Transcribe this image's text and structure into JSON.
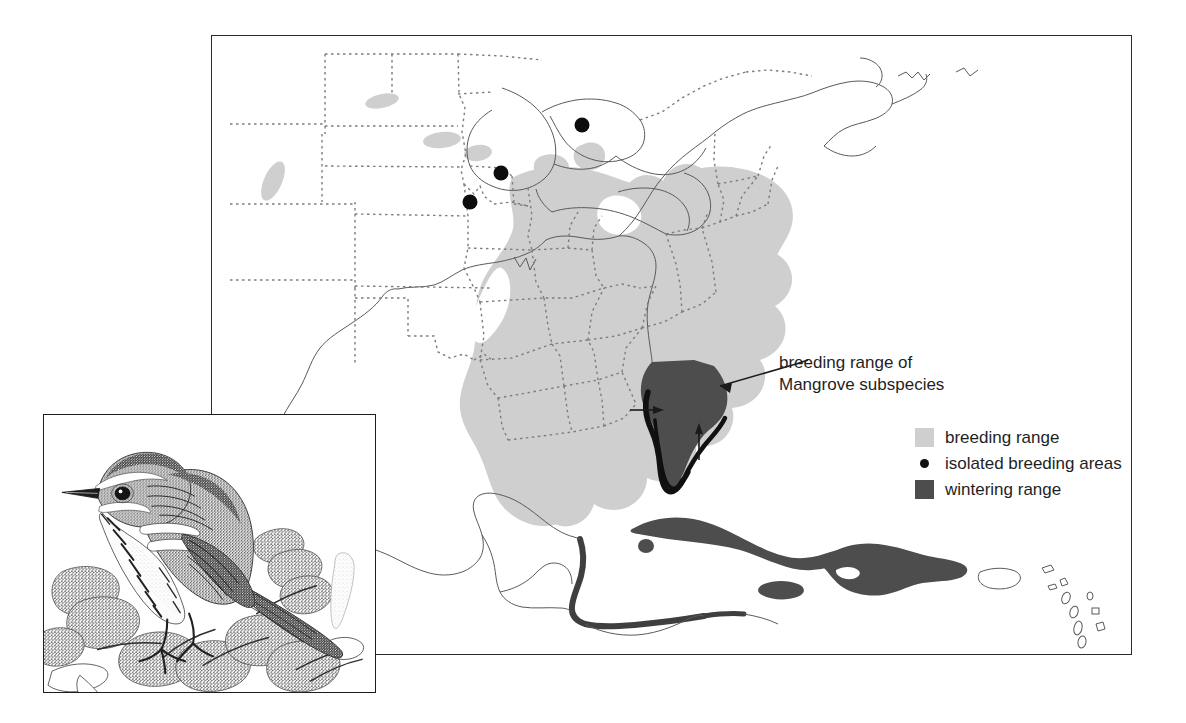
{
  "figure": {
    "kind": "range-map-with-illustration"
  },
  "annotation": {
    "line1": "breeding range of",
    "line2": "Mangrove subspecies"
  },
  "legend": {
    "items": [
      {
        "key": "breeding",
        "label": "breeding range",
        "symbol": "swatch",
        "color": "#cfcfcf"
      },
      {
        "key": "isolated",
        "label": "isolated breeding areas",
        "symbol": "dot",
        "color": "#111111"
      },
      {
        "key": "wintering",
        "label": "wintering range",
        "symbol": "swatch",
        "color": "#4d4d4d"
      }
    ]
  },
  "colors": {
    "breeding_fill": "#cfcfcf",
    "wintering_fill": "#4d4d4d",
    "mangrove_edge": "#111111",
    "coastline": "#5a5a5a",
    "state_border": "#7d7d7d",
    "frame": "#2b2b2b",
    "text": "#1f1f1f",
    "paper": "#ffffff"
  },
  "map": {
    "frame": {
      "x": 211,
      "y": 35,
      "width": 921,
      "height": 620
    },
    "isolated_breeding_dots": [
      {
        "id": "michigan",
        "cx": 581,
        "cy": 124,
        "r": 7
      },
      {
        "id": "iowa",
        "cx": 500,
        "cy": 172,
        "r": 7
      },
      {
        "id": "nebraska",
        "cx": 469,
        "cy": 201,
        "r": 7
      }
    ],
    "arrows_to_mangrove": [
      {
        "id": "arrow-annotation",
        "from": [
          795,
          363
        ],
        "to": [
          717,
          385
        ]
      },
      {
        "id": "arrow-west-coast",
        "from": [
          641,
          409
        ],
        "to": [
          673,
          409
        ]
      },
      {
        "id": "arrow-south",
        "from": [
          709,
          455
        ],
        "to": [
          709,
          421
        ]
      }
    ],
    "wintering_regions": [
      "peninsular Florida",
      "Cuba",
      "Jamaica",
      "Hispaniola",
      "Caribbean coast of Central America"
    ],
    "breeding_regions": [
      "eastern United States",
      "southern Ontario patches",
      "northeastern United States patches"
    ]
  },
  "bird_inset": {
    "frame": {
      "x": 43,
      "y": 414,
      "width": 333,
      "height": 279
    },
    "style": "stippled pen-and-ink illustration",
    "subject": "warbler perched on mangrove foliage"
  }
}
